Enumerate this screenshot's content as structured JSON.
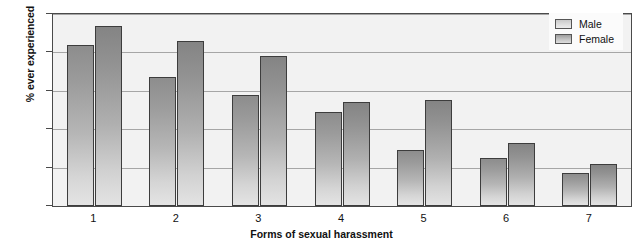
{
  "chart_data": {
    "type": "bar",
    "title": "",
    "xlabel": "Forms of sexual harassment",
    "ylabel": "% ever experienced",
    "categories": [
      "1",
      "2",
      "3",
      "4",
      "5",
      "6",
      "7"
    ],
    "series": [
      {
        "name": "Male",
        "values": [
          84,
          67,
          58,
          49,
          29,
          25,
          17
        ]
      },
      {
        "name": "Female",
        "values": [
          94,
          86,
          78,
          54,
          55,
          33,
          22
        ]
      }
    ],
    "ylim": [
      0,
      100
    ],
    "yticks": [
      0,
      20,
      40,
      60,
      80,
      100
    ],
    "ytick_labels": [
      "0",
      "20",
      "40",
      "60",
      "80",
      "100"
    ],
    "grid": "horizontal",
    "legend_position": "top-right",
    "colors": {
      "bar_top": "#8d8d8d",
      "bar_bottom": "#e4e4e4",
      "bar_edge": "#3d3d3d",
      "gridline": "#a6a6a6",
      "plot_background": "#f2f2f2",
      "axis": "#4a4a4a",
      "text": "#111111",
      "figure_background": "#ffffff"
    }
  },
  "legend": {
    "entries": [
      {
        "label": "Male"
      },
      {
        "label": "Female"
      }
    ]
  }
}
